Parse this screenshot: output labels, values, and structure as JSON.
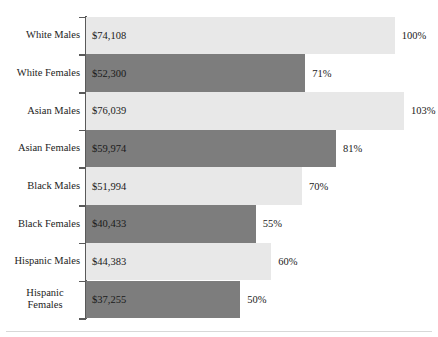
{
  "chart_data": {
    "type": "bar",
    "orientation": "horizontal",
    "title": "",
    "subtitle": "",
    "xlabel": "",
    "ylabel": "",
    "grid": false,
    "legend": "none",
    "axis": {
      "visible": true,
      "position": "left",
      "ticks_at_category_boundaries": true
    },
    "xlim": [
      0,
      103
    ],
    "categories": [
      "White Males",
      "White Females",
      "Asian Males",
      "Asian Females",
      "Black Males",
      "Black Females",
      "Hispanic Males",
      "Hispanic\nFemales"
    ],
    "value_labels": [
      "$74,108",
      "$52,300",
      "$76,039",
      "$59,974",
      "$51,994",
      "$40,433",
      "$44,383",
      "$37,255"
    ],
    "values": [
      74108,
      52300,
      76039,
      59974,
      51994,
      40433,
      44383,
      37255
    ],
    "percent_labels": [
      "100%",
      "71%",
      "103%",
      "81%",
      "70%",
      "55%",
      "60%",
      "50%"
    ],
    "percents": [
      100,
      71,
      103,
      81,
      70,
      55,
      60,
      50
    ],
    "bar_shades": [
      "light",
      "dark",
      "light",
      "dark",
      "light",
      "dark",
      "light",
      "dark"
    ],
    "colors": {
      "bar_light": "#e8e8e8",
      "bar_dark": "#7d7d7d",
      "axis": "#595959",
      "text": "#1a1a1a",
      "background": "#ffffff"
    }
  }
}
